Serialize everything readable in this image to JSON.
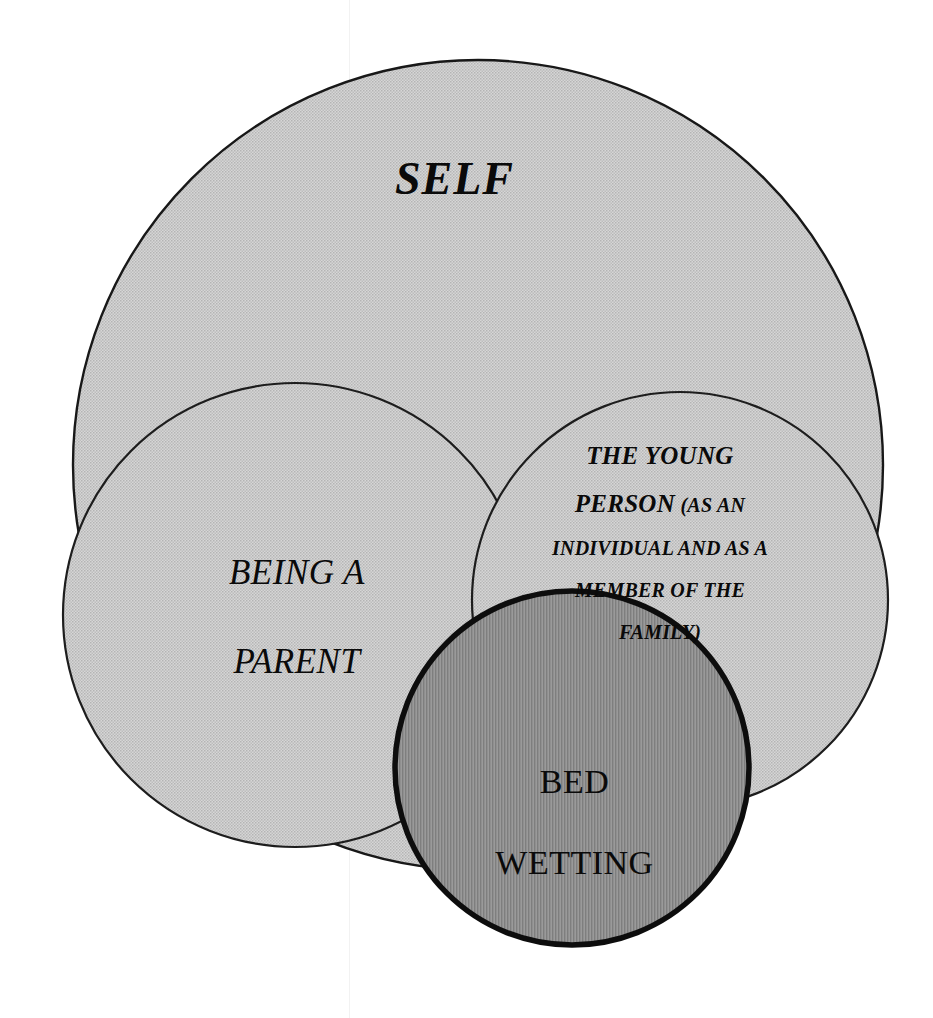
{
  "diagram": {
    "kind": "nested-venn-circles",
    "title_text": "SELF",
    "background_color": "#ffffff",
    "line_color": "#181818",
    "light_fill_color": "#c9c9c9",
    "dark_fill_color": "#8e8e8e",
    "text_color": "#0a0a0a",
    "circles": [
      {
        "id": "self",
        "label": "SELF",
        "fill": "#c9c9c9",
        "texture": "fine-halftone-dots",
        "cx": 478,
        "cy": 465,
        "r": 405,
        "stroke_width": 2.4,
        "layer": 1
      },
      {
        "id": "being-a-parent",
        "label": "BEING A\nPARENT",
        "fill": "#c9c9c9",
        "texture": "fine-halftone-dots",
        "cx": 295,
        "cy": 615,
        "r": 232,
        "stroke_width": 2.2,
        "layer": 2
      },
      {
        "id": "the-young-person",
        "label": "THE YOUNG PERSON (AS AN INDIVIDUAL AND AS A MEMBER OF THE FAMILY)",
        "fill": "#c9c9c9",
        "texture": "fine-halftone-dots",
        "cx": 680,
        "cy": 600,
        "r": 208,
        "stroke_width": 2.2,
        "layer": 3
      },
      {
        "id": "bed-wetting",
        "label": "BED\nWETTING",
        "fill": "#8e8e8e",
        "texture": "vertical-lines",
        "cx": 572,
        "cy": 768,
        "r": 177,
        "stroke_width": 5.5,
        "layer": 4
      }
    ]
  },
  "labels": {
    "self": "SELF",
    "being_a_parent_line1": "BEING A",
    "being_a_parent_line2": "PARENT",
    "young_person_line1": "THE YOUNG",
    "young_person_line2_big": "PERSON",
    "young_person_line2_small": " (AS AN",
    "young_person_line3": "INDIVIDUAL AND AS A",
    "young_person_line4": "MEMBER OF THE",
    "young_person_line5": "FAMILY)",
    "bed_wetting_line1": "BED",
    "bed_wetting_line2": "WETTING"
  }
}
